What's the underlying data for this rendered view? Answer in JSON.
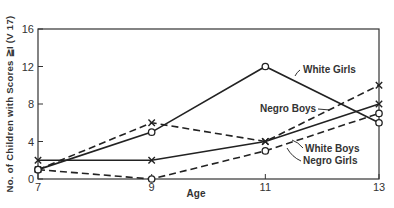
{
  "chart_data": {
    "type": "line",
    "title": "",
    "xlabel": "Age",
    "ylabel": "No. of Children with Scores ≧I (V 17)",
    "x": [
      7,
      9,
      11,
      13
    ],
    "xticks": [
      "7",
      "9",
      "11",
      "13"
    ],
    "yticks": [
      "0",
      "4",
      "8",
      "12",
      "16"
    ],
    "ylim": [
      0,
      16
    ],
    "grid": false,
    "series": [
      {
        "name": "White Girls",
        "style": "solid",
        "marker": "o",
        "values": [
          1,
          5,
          12,
          6
        ]
      },
      {
        "name": "Negro Boys",
        "style": "dashed",
        "marker": "x",
        "values": [
          1,
          6,
          4,
          10
        ]
      },
      {
        "name": "White Boys",
        "style": "solid",
        "marker": "x",
        "values": [
          2,
          2,
          4,
          8
        ]
      },
      {
        "name": "Negro Girls",
        "style": "dashed",
        "marker": "o",
        "values": [
          1,
          0,
          3,
          7
        ]
      }
    ],
    "annotations": [
      "White Girls",
      "Negro Boys",
      "White Boys",
      "Negro Girls"
    ]
  }
}
